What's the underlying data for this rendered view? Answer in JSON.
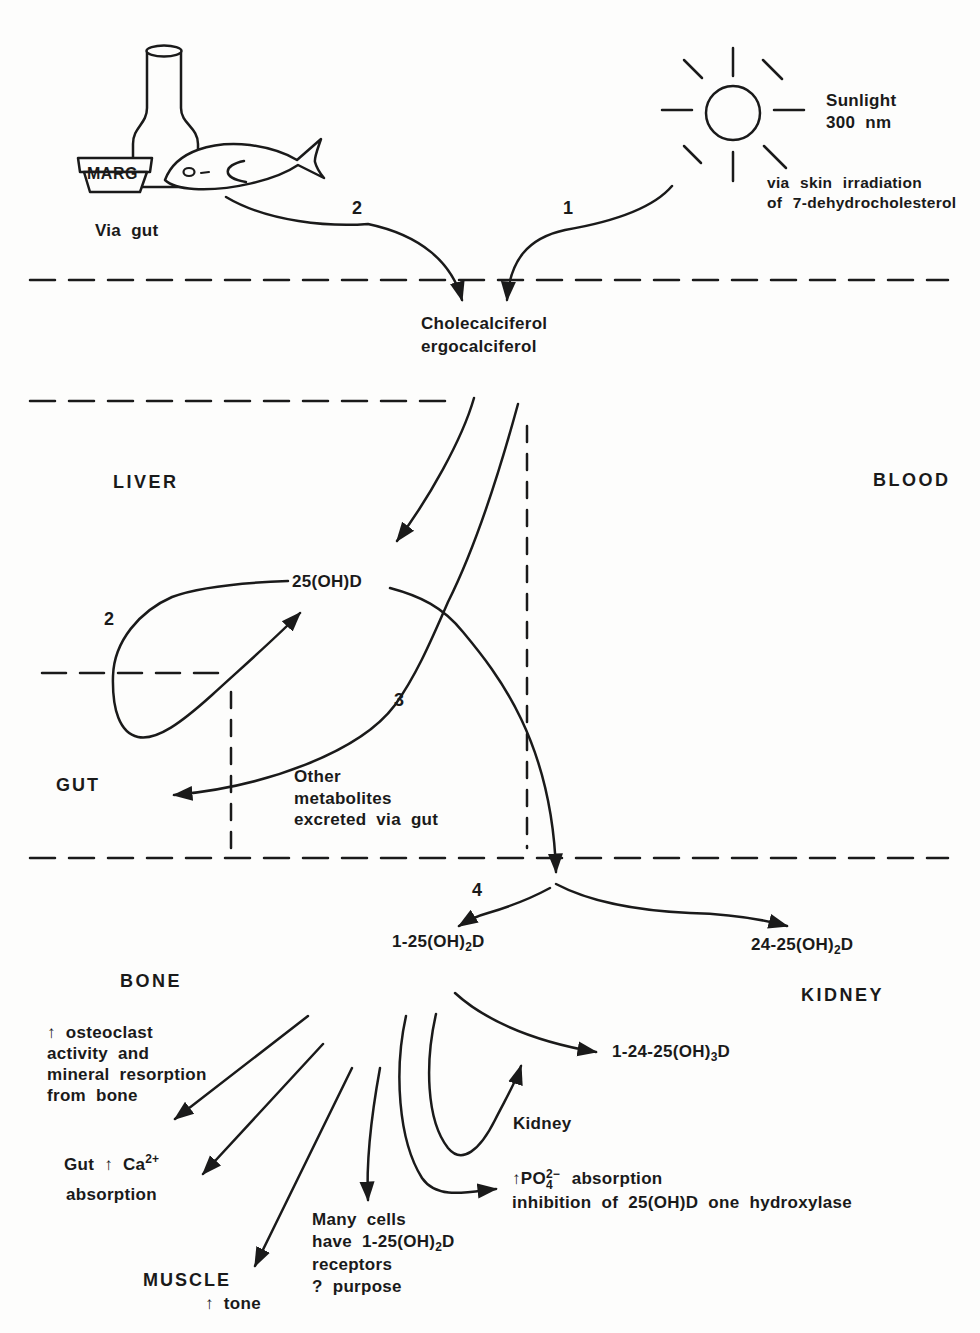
{
  "diagram": {
    "sources": {
      "marg": "MARG",
      "via_gut": "Via gut",
      "sunlight_line1": "Sunlight",
      "sunlight_line2": "300 nm",
      "skin_line1": "via skin irradiation",
      "skin_line2": "of 7-dehydrocholesterol"
    },
    "steps": {
      "s1": "1",
      "s2": "2",
      "s2_loop": "2",
      "s3": "3",
      "s4": "4"
    },
    "compartments": {
      "liver": "LIVER",
      "blood": "BLOOD",
      "gut": "GUT",
      "bone": "BONE",
      "kidney": "KIDNEY",
      "muscle": "MUSCLE"
    },
    "metabolites": {
      "chole_line1": "Cholecalciferol",
      "chole_line2": "ergocalciferol",
      "d25": "25(OH)D",
      "d125": {
        "pre": "1-25(OH)",
        "sub": "2",
        "post": "D"
      },
      "d2425": {
        "pre": "24-25(OH)",
        "sub": "2",
        "post": "D"
      },
      "d12425": {
        "pre": "1-24-25(OH)",
        "sub": "3",
        "post": "D"
      }
    },
    "annotations": {
      "other_line1": "Other",
      "other_line2": "metabolites",
      "other_line3": "excreted via gut",
      "osteo_line1": "↑ osteoclast",
      "osteo_line2": "activity and",
      "osteo_line3": "mineral resorption",
      "osteo_line4": "from bone",
      "gutca_pre": "Gut ↑ Ca",
      "gutca_sup": "2+",
      "gutca_line2": "absorption",
      "muscle_tone": "↑ tone",
      "many_line1": "Many cells",
      "many_line2_pre": "have 1-25(OH)",
      "many_line2_sub": "2",
      "many_line2_post": "D",
      "many_line3": "receptors",
      "many_line4": "? purpose",
      "kidney_enzyme": "Kidney",
      "po4_arrow": "↑",
      "po4_pre": "PO",
      "po4_sub": "4",
      "po4_sup": "2−",
      "po4_word": "absorption",
      "po4_line2": "inhibition of 25(OH)D one hydroxylase"
    }
  }
}
